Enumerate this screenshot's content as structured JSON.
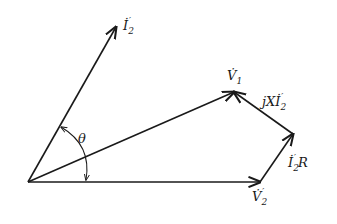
{
  "diagram": {
    "type": "phasor-diagram",
    "origin": [
      28,
      182
    ],
    "vectors": [
      {
        "id": "I2p",
        "from": [
          28,
          182
        ],
        "to": [
          116,
          27
        ],
        "label_main": "İ",
        "label_sub": "2",
        "label_prime": "′"
      },
      {
        "id": "V1",
        "from": [
          28,
          182
        ],
        "to": [
          234,
          92
        ],
        "label_main": "V̇",
        "label_sub": "1",
        "label_prime": ""
      },
      {
        "id": "V2p",
        "from": [
          28,
          182
        ],
        "to": [
          260,
          182
        ],
        "label_main": "V̇",
        "label_sub": "2",
        "label_prime": "′"
      },
      {
        "id": "I2pR",
        "from": [
          260,
          182
        ],
        "to": [
          293,
          134
        ],
        "label_main": "İ",
        "label_sub": "2",
        "label_prime": "′",
        "label_suffix": "R"
      },
      {
        "id": "jXI2p",
        "from": [
          293,
          134
        ],
        "to": [
          234,
          92
        ],
        "label_prefix": "jX",
        "label_main": "İ",
        "label_sub": "2",
        "label_prime": "′"
      }
    ],
    "angle": {
      "label": "θ",
      "between": [
        "I2p",
        "V2p"
      ]
    },
    "colors": {
      "ink": "#1a1a1a",
      "background": "#ffffff"
    }
  },
  "labels": {
    "i2p": {
      "main": "İ",
      "sub": "2",
      "prime": "′"
    },
    "v1": {
      "main": "V̇",
      "sub": "1"
    },
    "jxi2p": {
      "prefix": "jX",
      "main": "İ",
      "sub": "2",
      "prime": "′"
    },
    "i2pr": {
      "main": "İ",
      "sub": "2",
      "prime": "′",
      "suffix": "R"
    },
    "v2p": {
      "main": "V̇",
      "sub": "2",
      "prime": "′"
    },
    "theta": "θ"
  }
}
